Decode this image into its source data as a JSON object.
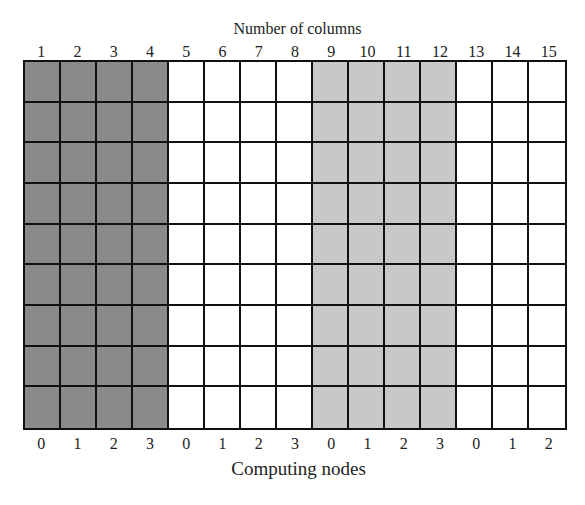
{
  "diagram": {
    "top_title": "Number of columns",
    "bottom_title": "Computing nodes",
    "rows": 9,
    "columns": [
      "1",
      "2",
      "3",
      "4",
      "5",
      "6",
      "7",
      "8",
      "9",
      "10",
      "11",
      "12",
      "13",
      "14",
      "15"
    ],
    "node_labels": [
      "0",
      "1",
      "2",
      "3",
      "0",
      "1",
      "2",
      "3",
      "0",
      "1",
      "2",
      "3",
      "0",
      "1",
      "2"
    ],
    "column_groups": [
      {
        "columns": [
          1,
          2,
          3,
          4
        ],
        "fill": "dark-gray",
        "color": "#8a8a8a"
      },
      {
        "columns": [
          5,
          6,
          7,
          8
        ],
        "fill": "white",
        "color": "#ffffff"
      },
      {
        "columns": [
          9,
          10,
          11,
          12
        ],
        "fill": "light-gray",
        "color": "#c8c8c8"
      },
      {
        "columns": [
          13,
          14,
          15
        ],
        "fill": "white",
        "color": "#ffffff"
      }
    ],
    "grid_line_color": "#111111"
  }
}
